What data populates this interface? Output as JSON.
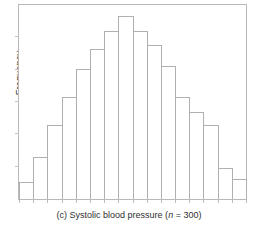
{
  "figure": {
    "caption_prefix": "(c) Systolic blood pressure (",
    "caption_n_symbol": "n",
    "caption_suffix": " = 300)",
    "caption_full": "(c) Systolic blood pressure (n = 300)",
    "panel_letter": "(c)",
    "sample_size": 300,
    "frame_color": "#b9b9b9",
    "bar_outline_color": "#b0b0b0"
  },
  "chart_data": {
    "type": "bar",
    "title": "",
    "subtitle": "",
    "xlabel": "Systolic blood pressure",
    "ylabel": "Frequency",
    "categories": [
      "1",
      "2",
      "3",
      "4",
      "5",
      "6",
      "7",
      "8",
      "9",
      "10",
      "11",
      "12",
      "13",
      "14",
      "15",
      "16"
    ],
    "values": [
      12,
      30,
      53,
      73,
      93,
      107,
      120,
      131,
      120,
      110,
      95,
      73,
      62,
      53,
      22,
      14
    ],
    "ylim": [
      0,
      140
    ],
    "xlim": [
      0,
      16
    ],
    "grid": false,
    "legend": null,
    "legend_position": "none",
    "xtick_labels": [],
    "ytick_labels": [],
    "annotations": [
      "(c) Systolic blood pressure (n = 300)"
    ],
    "n_bars": 16,
    "distribution_shape": "bell-shaped / approximately normal"
  }
}
